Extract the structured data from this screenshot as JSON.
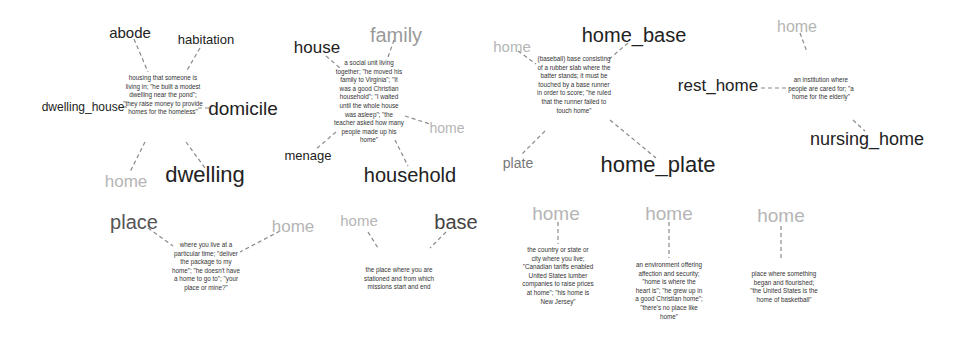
{
  "diagram": {
    "title": "",
    "line_color": "#8a8a8a",
    "synsets": [
      {
        "id": "dwelling",
        "gloss": "housing that someone is living in; \"he built a modest dwelling near the pond\"; \"they raise money to provide homes for the homeless\"",
        "words": [
          "abode",
          "habitation",
          "dwelling_house",
          "domicile",
          "home",
          "dwelling"
        ]
      },
      {
        "id": "household",
        "gloss": "a social unit living together; \"he moved his family to Virginia\"; \"It was a good Christian household\"; \"I waited until the whole house was asleep\"; \"the teacher asked how many people made up his home\"",
        "words": [
          "house",
          "family",
          "home",
          "menage",
          "household"
        ]
      },
      {
        "id": "home_plate",
        "gloss": "(baseball) base consisting of a rubber slab where the batter stands; it must be touched by a base runner in order to score; \"he ruled that the runner failed to touch home\"",
        "words": [
          "home",
          "home_base",
          "plate",
          "home_plate"
        ]
      },
      {
        "id": "nursing_home",
        "gloss": "an institution where people are cared for; \"a home for the elderly\"",
        "words": [
          "home",
          "rest_home",
          "nursing_home"
        ]
      },
      {
        "id": "place",
        "gloss": "where you live at a particular time; \"deliver the package to my home\"; \"he doesn't have a home to go to\"; \"your place or mine?\"",
        "words": [
          "place",
          "home"
        ]
      },
      {
        "id": "base",
        "gloss": "the place where you are stationed and from which missions start and end",
        "words": [
          "home",
          "base"
        ]
      },
      {
        "id": "home_country",
        "gloss": "the country or state or city where you live; \"Canadian tariffs enabled United States lumber companies to raise prices at home\"; \"his home is New Jersey\"",
        "words": [
          "home"
        ]
      },
      {
        "id": "home_environment",
        "gloss": "an environment offering affection and security; \"home is where the heart is\"; \"he grew up in a good Christian home\"; \"there's no place like home\"",
        "words": [
          "home"
        ]
      },
      {
        "id": "home_origin",
        "gloss": "place where something began and flourished; \"the United States is the home of basketball\"",
        "words": [
          "home"
        ]
      }
    ]
  },
  "labels": {
    "s1": {
      "gloss": "housing that someone is living in; \"he built a modest dwelling near the pond\"; \"they raise money to provide homes for the homeless\"",
      "w_abode": "abode",
      "w_habitation": "habitation",
      "w_dwelling_house": "dwelling_house",
      "w_domicile": "domicile",
      "w_home": "home",
      "w_dwelling": "dwelling"
    },
    "s2": {
      "gloss": "a social unit living together; \"he moved his family to Virginia\"; \"It was a good Christian household\"; \"I waited until the whole house was asleep\"; \"the teacher asked how many people made up his home\"",
      "w_house": "house",
      "w_family": "family",
      "w_home": "home",
      "w_menage": "menage",
      "w_household": "household"
    },
    "s3": {
      "gloss": "(baseball) base consisting of a rubber slab where the batter stands; it must be touched by a base runner in order to score; \"he ruled that the runner failed to touch home\"",
      "w_home": "home",
      "w_home_base": "home_base",
      "w_plate": "plate",
      "w_home_plate": "home_plate"
    },
    "s4": {
      "gloss": "an institution where people are cared for; \"a home for the elderly\"",
      "w_home": "home",
      "w_rest_home": "rest_home",
      "w_nursing_home": "nursing_home"
    },
    "s5": {
      "gloss": "where you live at a particular time; \"deliver the package to my home\"; \"he doesn't have a home to go to\"; \"your place or mine?\"",
      "w_place": "place",
      "w_home": "home"
    },
    "s6": {
      "gloss": "the place where you are stationed and from which missions start and end",
      "w_home": "home",
      "w_base": "base"
    },
    "s7": {
      "gloss": "the country or state or city where you live; \"Canadian tariffs enabled United States lumber companies to raise prices at home\"; \"his home is New Jersey\"",
      "w_home": "home"
    },
    "s8": {
      "gloss": "an environment offering affection and security; \"home is where the heart is\"; \"he grew up in a good Christian home\"; \"there's no place like home\"",
      "w_home": "home"
    },
    "s9": {
      "gloss": "place where something began and flourished; \"the United States is the home of basketball\"",
      "w_home": "home"
    }
  }
}
